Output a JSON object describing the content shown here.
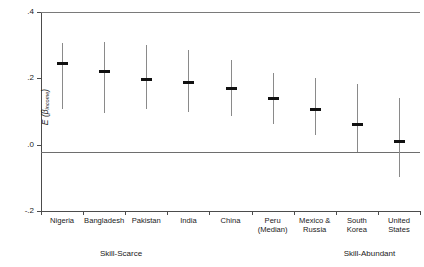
{
  "chart_data": {
    "type": "scatter",
    "title": "",
    "xlabel": "",
    "ylabel": "E (βincome)",
    "ylabel_main": "E (β",
    "ylabel_sub": "income",
    "ylabel_tail": ")",
    "ylim": [
      -0.2,
      0.4
    ],
    "yticks": [
      0.4,
      0.2,
      0.0,
      -0.2
    ],
    "ytick_labels": [
      ".4",
      ".2",
      ".0",
      "-.2"
    ],
    "grid": false,
    "legend": "none",
    "zero_reference_line": 0.0,
    "categories": [
      "Nigeria",
      "Bangladesh",
      "Pakistan",
      "India",
      "China",
      "Peru (Median)",
      "Mexico & Russia",
      "South Korea",
      "United States"
    ],
    "category_lines": [
      [
        "Nigeria",
        ""
      ],
      [
        "Bangladesh",
        ""
      ],
      [
        "Pakistan",
        ""
      ],
      [
        "India",
        ""
      ],
      [
        "China",
        ""
      ],
      [
        "Peru",
        "(Median)"
      ],
      [
        "Mexico &",
        "Russia"
      ],
      [
        "South",
        "Korea"
      ],
      [
        "United",
        "States"
      ]
    ],
    "values": [
      0.246,
      0.22,
      0.197,
      0.188,
      0.168,
      0.14,
      0.105,
      0.062,
      0.011
    ],
    "ci_low": [
      0.109,
      0.094,
      0.106,
      0.097,
      0.086,
      0.063,
      0.028,
      -0.023,
      -0.097
    ],
    "ci_high": [
      0.306,
      0.309,
      0.3,
      0.285,
      0.254,
      0.217,
      0.2,
      0.182,
      0.14
    ],
    "annotations": [
      {
        "text": "Skill-Scarce",
        "x_category_index": 1.4
      },
      {
        "text": "Skill-Abundant",
        "x_category_index": 7.3
      }
    ],
    "marker_color": "#111111",
    "whisker_color": "#8a8a8a",
    "axis_color": "#4c4c4c"
  }
}
